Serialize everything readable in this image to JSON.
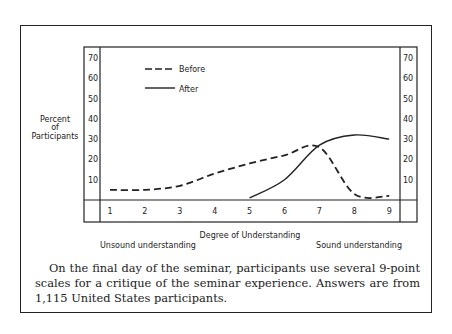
{
  "chart_data": {
    "type": "line",
    "title": "",
    "xlabel": "Degree of Understanding",
    "ylabel": "Percent of Participants",
    "x": [
      1,
      2,
      3,
      4,
      5,
      6,
      7,
      8,
      9
    ],
    "xtick_labels": [
      "1",
      "2",
      "3",
      "4",
      "5",
      "6",
      "7",
      "8",
      "9"
    ],
    "ytick_labels": [
      "10",
      "20",
      "30",
      "40",
      "50",
      "60",
      "70"
    ],
    "ylim": [
      0,
      70
    ],
    "x_extremes": {
      "left": "Unsound understanding",
      "right": "Sound understanding"
    },
    "legend": [
      {
        "name": "Before",
        "style": "dashed"
      },
      {
        "name": "After",
        "style": "solid"
      }
    ],
    "legend_position": "upper left",
    "grid": false,
    "series": [
      {
        "name": "Before",
        "style": "dashed",
        "x": [
          1,
          2,
          3,
          4,
          5,
          6,
          7,
          8,
          9
        ],
        "values": [
          5,
          5,
          7,
          13,
          18,
          22,
          26,
          3,
          2
        ]
      },
      {
        "name": "After",
        "style": "solid",
        "x": [
          5,
          6,
          7,
          8,
          9
        ],
        "values": [
          1,
          10,
          27,
          32,
          30
        ]
      }
    ]
  },
  "labels": {
    "ylabel_line1": "Percent",
    "ylabel_line2": "of",
    "ylabel_line3": "Participants",
    "xlabel": "Degree of Understanding",
    "left_extreme": "Unsound understanding",
    "right_extreme": "Sound understanding",
    "legend_before": "Before",
    "legend_after": "After"
  },
  "caption": "On the final day of the seminar, participants use several 9-point scales for a critique of the seminar experience. Answers are from 1,115 United States participants."
}
